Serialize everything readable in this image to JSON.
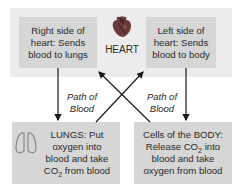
{
  "diagram": {
    "heart": {
      "icon": "heart-icon",
      "label": "HEART"
    },
    "boxes": {
      "right_heart": {
        "lines": [
          "Right side of",
          "heart: Sends",
          "blood to lungs"
        ]
      },
      "left_heart": {
        "lines": [
          "Left side of",
          "heart: Sends",
          "blood to body"
        ]
      },
      "lungs": {
        "icon": "lungs-icon",
        "line1": "LUNGS: Put",
        "line2": "oxygen into",
        "line3": "blood and take",
        "line4_pre": "CO",
        "line4_sub": "2",
        "line4_post": " from blood"
      },
      "body": {
        "line1": "Cells of the BODY:",
        "line2_pre": "Release CO",
        "line2_sub": "2",
        "line2_post": " into",
        "line3": "blood and take",
        "line4": "oxygen from blood"
      }
    },
    "path_labels": {
      "left": {
        "line1": "Path of",
        "line2": "Blood"
      },
      "right": {
        "line1": "Path of",
        "line2": "Blood"
      }
    },
    "colors": {
      "band": "#ececec",
      "box": "#d6d6d6",
      "arrow": "#1a1a1a",
      "heart": "#6a3a3a"
    }
  }
}
